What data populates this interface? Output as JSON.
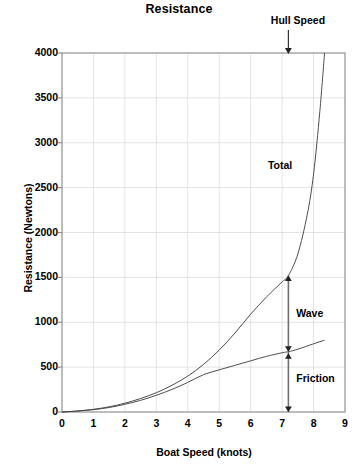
{
  "chart_data": {
    "type": "line",
    "title": "Resistance",
    "xlabel": "Boat Speed  (knots)",
    "ylabel": "Resistance  (Newtons)",
    "xlim": [
      0,
      9
    ],
    "ylim": [
      0,
      4000
    ],
    "xticks": [
      0,
      1,
      2,
      3,
      4,
      5,
      6,
      7,
      8,
      9
    ],
    "yticks": [
      0,
      500,
      1000,
      1500,
      2000,
      2500,
      3000,
      3500,
      4000
    ],
    "grid": true,
    "legend_position": "inline-annotations",
    "series": [
      {
        "name": "Total",
        "x": [
          0,
          0.5,
          1,
          1.5,
          2,
          2.5,
          3,
          3.5,
          4,
          4.5,
          5,
          5.5,
          6,
          6.5,
          7,
          7.2,
          7.5,
          7.8,
          8,
          8.2,
          8.35
        ],
        "values": [
          0,
          12,
          30,
          58,
          98,
          150,
          215,
          298,
          400,
          530,
          690,
          880,
          1090,
          1280,
          1450,
          1520,
          1760,
          2200,
          2650,
          3350,
          4000
        ]
      },
      {
        "name": "Friction",
        "x": [
          0,
          0.5,
          1,
          1.5,
          2,
          2.5,
          3,
          3.5,
          4,
          4.5,
          5,
          5.5,
          6,
          6.5,
          7,
          7.2,
          7.5,
          8,
          8.35
        ],
        "values": [
          0,
          10,
          26,
          50,
          86,
          130,
          186,
          252,
          330,
          416,
          470,
          520,
          570,
          620,
          660,
          672,
          700,
          760,
          800
        ]
      }
    ],
    "annotations": [
      {
        "label": "Hull Speed",
        "type": "down-arrow",
        "x": 7.2,
        "y": 4000
      },
      {
        "label": "Total",
        "type": "curve-label",
        "x": 6.55,
        "y": 2750
      },
      {
        "label": "Wave",
        "type": "range-label",
        "x": 7.45,
        "y": 1100
      },
      {
        "label": "Friction",
        "type": "range-label",
        "x": 7.45,
        "y": 380
      }
    ],
    "range_marker": {
      "x": 7.2,
      "segments": [
        {
          "name": "Wave",
          "from": 672,
          "to": 1520
        },
        {
          "name": "Friction",
          "from": 0,
          "to": 672
        }
      ]
    },
    "colors": {
      "curve": "#444444",
      "grid": "#d8d8d8",
      "axis": "#888888",
      "text": "#000000",
      "background": "#ffffff"
    }
  },
  "caption": {
    "text": ""
  }
}
